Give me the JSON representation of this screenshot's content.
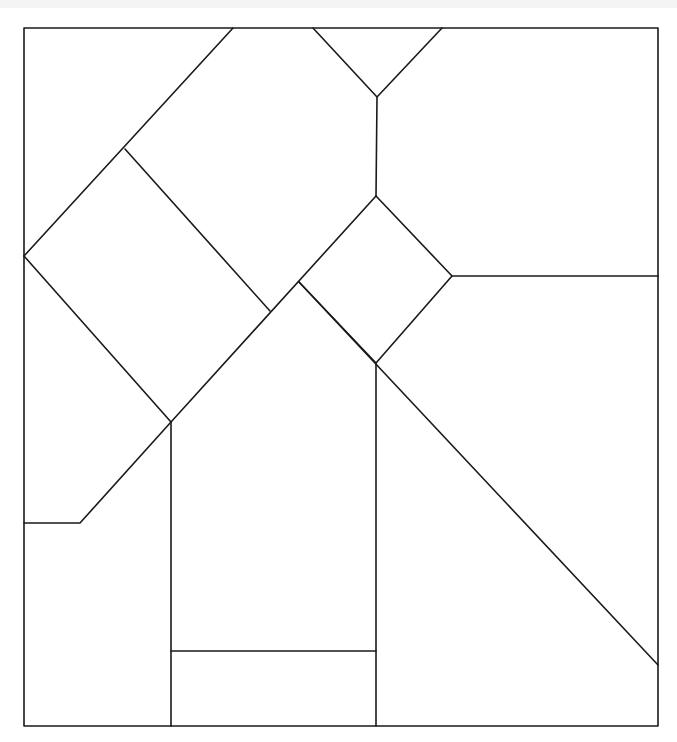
{
  "diagram": {
    "title": "",
    "stroke_color": "#1a1a1a",
    "background_color": "#ffffff",
    "labels": []
  }
}
